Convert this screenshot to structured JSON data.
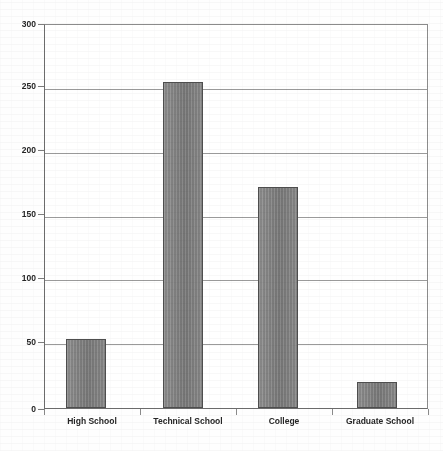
{
  "chart_data": {
    "type": "bar",
    "title": "",
    "subtitle": "",
    "xlabel": "",
    "ylabel": "",
    "categories": [
      "High School",
      "Technical School",
      "College",
      "Graduate School"
    ],
    "values": [
      54,
      255,
      173,
      20
    ],
    "ylim": [
      0,
      300
    ],
    "ytick_labels": [
      "0",
      "50",
      "100",
      "150",
      "200",
      "250",
      "300"
    ],
    "ytick_values": [
      0,
      50,
      100,
      150,
      200,
      250,
      300
    ],
    "grid": true,
    "legend": "none",
    "series": [
      {
        "name": "",
        "values": [
          54,
          255,
          173,
          20
        ]
      }
    ],
    "annotations": [],
    "colors": {
      "bar_fill": "#838383",
      "bar_border": "#4e4e4e",
      "gridline": "#9a9a9a",
      "axis": "#6e6e6e",
      "text": "#262626",
      "background": "#ffffff"
    }
  },
  "axis": {
    "y": {
      "ticks": [
        {
          "label": "300",
          "value": 300
        },
        {
          "label": "250",
          "value": 250
        },
        {
          "label": "200",
          "value": 200
        },
        {
          "label": "150",
          "value": 150
        },
        {
          "label": "100",
          "value": 100
        },
        {
          "label": "50",
          "value": 50
        },
        {
          "label": "0",
          "value": 0
        }
      ]
    },
    "x": {
      "ticks": [
        {
          "label": "High School"
        },
        {
          "label": "Technical School"
        },
        {
          "label": "College"
        },
        {
          "label": "Graduate School"
        }
      ]
    }
  }
}
